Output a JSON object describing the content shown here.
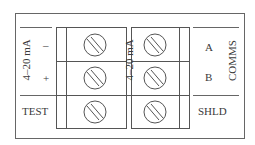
{
  "diagram": {
    "type": "terminal-block-wiring",
    "left_group": {
      "label": "4–20 mA",
      "terminals": [
        {
          "id": "minus",
          "label": "–"
        },
        {
          "id": "plus",
          "label": "+"
        }
      ],
      "test": {
        "label": "TEST"
      }
    },
    "middle_label": "4–20 mA",
    "right_group": {
      "label": "COMMS",
      "terminals": [
        {
          "id": "A",
          "label": "A"
        },
        {
          "id": "B",
          "label": "B"
        }
      ],
      "shield": {
        "label": "SHLD"
      }
    },
    "colors": {
      "line": "#555555",
      "background": "#ffffff"
    }
  }
}
